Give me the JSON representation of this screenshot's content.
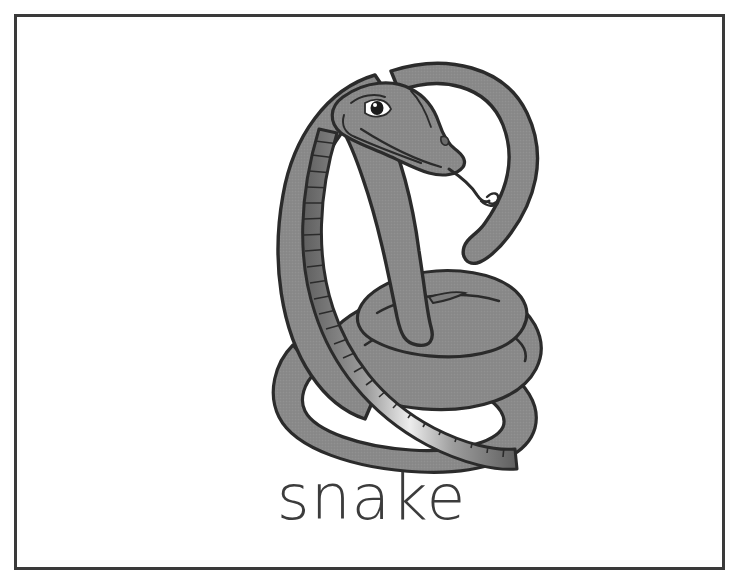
{
  "card": {
    "type": "picture-word-flashcard",
    "background_color": "#ffffff",
    "border_color": "#3a3a3a",
    "border_width_px": 3
  },
  "illustration": {
    "subject": "snake",
    "icon_name": "cobra-illustration",
    "description": "A coiled gray cobra rearing up with a flared hood, forked tongue extended, and a banded light-gray belly wrapping around its dark-outlined coils.",
    "style": "line-art with halftone gray fill",
    "colors": {
      "body_fill": "#878787",
      "body_fill_shadow": "#6f6f6f",
      "belly_dark": "#6a6a6a",
      "belly_light": "#e8e8e8",
      "outline": "#2b2b2b",
      "eye": "#1a1a1a",
      "white": "#ffffff"
    },
    "parts": [
      "head",
      "eye",
      "nostril",
      "mouth",
      "forked-tongue",
      "hood",
      "neck",
      "banded-belly",
      "coiled-body",
      "tail-tip"
    ]
  },
  "caption": {
    "text": "snake",
    "color": "#3c3c3c",
    "font_size_px": 63
  }
}
